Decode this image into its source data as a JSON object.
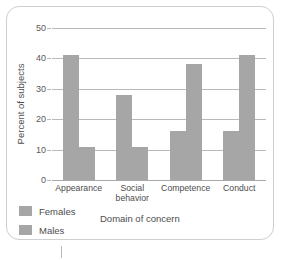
{
  "chart_data": {
    "type": "bar",
    "title": "",
    "xlabel": "Domain of concern",
    "ylabel": "Percent of subjects",
    "categories": [
      "Appearance",
      "Social behavior",
      "Competence",
      "Conduct"
    ],
    "category_lines": [
      [
        "Appearance"
      ],
      [
        "Social",
        "behavior"
      ],
      [
        "Competence"
      ],
      [
        "Conduct"
      ]
    ],
    "series": [
      {
        "name": "Females",
        "values": [
          41,
          28,
          16,
          16
        ]
      },
      {
        "name": "Males",
        "values": [
          11,
          11,
          38,
          41
        ]
      }
    ],
    "ylim": [
      0,
      50
    ],
    "yticks": [
      0,
      10,
      20,
      30,
      40,
      50
    ],
    "ytick_labels": [
      "0",
      "10",
      "20",
      "30",
      "40",
      "50"
    ],
    "grid": true,
    "legend_position": "bottom-left",
    "colors": {
      "bar": "#a6a6a6",
      "gridline": "#b9b9b9",
      "axis_text": "#4d4d4d",
      "tick_text": "#595959",
      "frame_border": "#cfcfcf",
      "background": "#ffffff"
    }
  }
}
